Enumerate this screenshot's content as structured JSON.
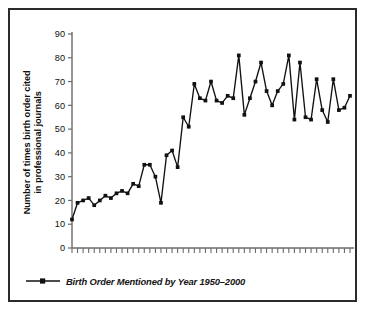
{
  "chart_data": {
    "type": "line",
    "title": "",
    "xlabel": "",
    "ylabel": "Number of times birth order cited in professional journals",
    "ylabel_line1": "Number of times birth order cited",
    "ylabel_line2": "in professional journals",
    "ylim": [
      0,
      90
    ],
    "yticks": [
      0,
      10,
      20,
      30,
      40,
      50,
      60,
      70,
      80,
      90
    ],
    "ytick_labels": [
      "0",
      "10",
      "20",
      "30",
      "40",
      "50",
      "60",
      "70",
      "80",
      "90"
    ],
    "xlim": [
      1950,
      2000
    ],
    "xticks_visible": false,
    "xtick_labels": [],
    "grid": false,
    "legend_position": "below-plot-left",
    "series": [
      {
        "name": "Birth Order Mentioned by Year 1950–2000",
        "marker": "filled-square",
        "color": "#111111",
        "x": [
          1950,
          1951,
          1952,
          1953,
          1954,
          1955,
          1956,
          1957,
          1958,
          1959,
          1960,
          1961,
          1962,
          1963,
          1964,
          1965,
          1966,
          1967,
          1968,
          1969,
          1970,
          1971,
          1972,
          1973,
          1974,
          1975,
          1976,
          1977,
          1978,
          1979,
          1980,
          1981,
          1982,
          1983,
          1984,
          1985,
          1986,
          1987,
          1988,
          1989,
          1990,
          1991,
          1992,
          1993,
          1994,
          1995,
          1996,
          1997,
          1998,
          1999,
          2000
        ],
        "values": [
          12,
          19,
          20,
          21,
          18,
          20,
          22,
          21,
          23,
          24,
          23,
          27,
          26,
          35,
          35,
          30,
          19,
          39,
          41,
          34,
          55,
          51,
          69,
          63,
          62,
          70,
          62,
          61,
          64,
          63,
          81,
          56,
          63,
          70,
          78,
          66,
          60,
          66,
          69,
          81,
          54,
          78,
          55,
          54,
          71,
          58,
          53,
          71,
          58,
          59,
          64
        ]
      }
    ],
    "annotations": []
  },
  "legend": {
    "entries": [
      {
        "label": "Birth Order Mentioned by Year 1950–2000",
        "marker": "filled-square"
      }
    ]
  },
  "axis": {
    "y_title_line1": "Number of times birth order cited",
    "y_title_line2": "in professional journals"
  },
  "style": {
    "frame_color": "#2b2b2b",
    "line_color": "#111111",
    "axis_color": "#6b6b6b",
    "background": "#ffffff"
  }
}
